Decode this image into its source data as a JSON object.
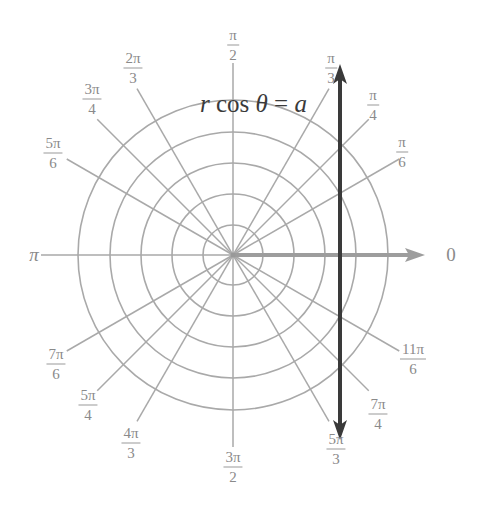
{
  "diagram": {
    "type": "polar-grid",
    "center": {
      "x": 233,
      "y": 255
    },
    "circle_radii": [
      30,
      61,
      92,
      123,
      155
    ],
    "spoke_length": 192,
    "grid_color": "#a9a9a9",
    "line_color": "#3a3a3a",
    "axis_arrow_color": "#9d9d9d",
    "equation": {
      "lhs_var": "r",
      "func": "cos",
      "angle_var": "θ",
      "equals": "=",
      "rhs_var": "a",
      "x": 200,
      "y": 102
    },
    "vertical_line": {
      "x": 340,
      "y_top": 64,
      "y_bottom": 440,
      "label": "x = a"
    },
    "angle_labels": [
      {
        "id": "0",
        "num": "0",
        "den": null,
        "x": 451,
        "y": 255
      },
      {
        "id": "pi-6",
        "num": "π",
        "den": "6",
        "x": 402,
        "y": 152
      },
      {
        "id": "pi-4",
        "num": "π",
        "den": "4",
        "x": 373,
        "y": 105
      },
      {
        "id": "pi-3",
        "num": "π",
        "den": "3",
        "x": 331,
        "y": 68
      },
      {
        "id": "pi-2",
        "num": "π",
        "den": "2",
        "x": 233,
        "y": 45
      },
      {
        "id": "2pi-3",
        "num": "2π",
        "den": "3",
        "x": 133,
        "y": 68
      },
      {
        "id": "3pi-4",
        "num": "3π",
        "den": "4",
        "x": 92,
        "y": 99
      },
      {
        "id": "5pi-6",
        "num": "5π",
        "den": "6",
        "x": 53,
        "y": 153
      },
      {
        "id": "pi",
        "num": "π",
        "den": null,
        "x": 34,
        "y": 255
      },
      {
        "id": "7pi-6",
        "num": "7π",
        "den": "6",
        "x": 56,
        "y": 364
      },
      {
        "id": "5pi-4",
        "num": "5π",
        "den": "4",
        "x": 88,
        "y": 405
      },
      {
        "id": "4pi-3",
        "num": "4π",
        "den": "3",
        "x": 131,
        "y": 443
      },
      {
        "id": "3pi-2",
        "num": "3π",
        "den": "2",
        "x": 233,
        "y": 467
      },
      {
        "id": "5pi-3",
        "num": "5π",
        "den": "3",
        "x": 336,
        "y": 449
      },
      {
        "id": "7pi-4",
        "num": "7π",
        "den": "4",
        "x": 378,
        "y": 414
      },
      {
        "id": "11pi-6",
        "num": "11π",
        "den": "6",
        "x": 413,
        "y": 359
      }
    ],
    "spoke_angles_deg": [
      30,
      45,
      60,
      90,
      120,
      135,
      150,
      180,
      210,
      225,
      240,
      270,
      300,
      315,
      330
    ],
    "polar_axis": {
      "angle_deg": 0,
      "label": "0",
      "arrow_tip_x": 425
    }
  }
}
